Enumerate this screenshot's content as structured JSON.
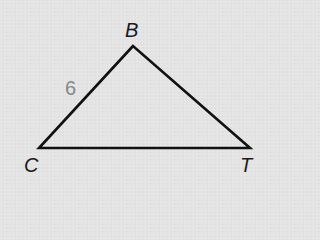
{
  "diagram": {
    "type": "triangle",
    "stroke_color": "#111111",
    "background_color": "#e4e4e4",
    "vertices": {
      "B": {
        "label": "B",
        "x": 133,
        "y": 46
      },
      "C": {
        "label": "C",
        "x": 39,
        "y": 148
      },
      "T": {
        "label": "T",
        "x": 250,
        "y": 148
      }
    },
    "sides": {
      "CB": {
        "label": "6",
        "color": "#888888"
      }
    }
  }
}
